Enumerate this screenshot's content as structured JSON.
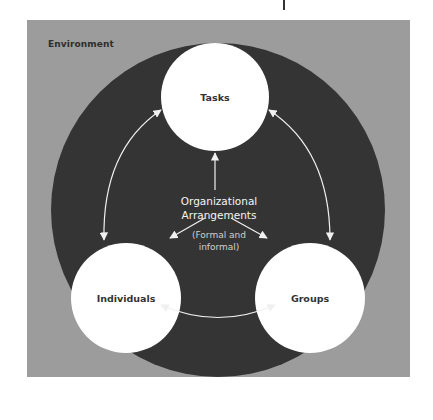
{
  "diagram": {
    "environment_label": "Environment",
    "center": {
      "title_line1": "Organizational",
      "title_line2": "Arrangements",
      "subtitle_line1": "(Formal and",
      "subtitle_line2": "informal)"
    },
    "nodes": [
      {
        "id": "tasks",
        "label": "Tasks"
      },
      {
        "id": "individuals",
        "label": "Individuals"
      },
      {
        "id": "groups",
        "label": "Groups"
      }
    ],
    "edges": [
      {
        "from": "tasks",
        "to": "individuals",
        "type": "bidirectional"
      },
      {
        "from": "tasks",
        "to": "groups",
        "type": "bidirectional"
      },
      {
        "from": "individuals",
        "to": "groups",
        "type": "bidirectional"
      },
      {
        "from": "organizational-arrangements",
        "to": "tasks",
        "type": "directed"
      },
      {
        "from": "organizational-arrangements",
        "to": "individuals",
        "type": "directed"
      },
      {
        "from": "organizational-arrangements",
        "to": "groups",
        "type": "directed"
      }
    ],
    "colors": {
      "environment": "#9c9c9c",
      "core": "#343434",
      "node": "#ffffff",
      "arrow": "#f0f0f0",
      "label_dark": "#333333"
    }
  }
}
